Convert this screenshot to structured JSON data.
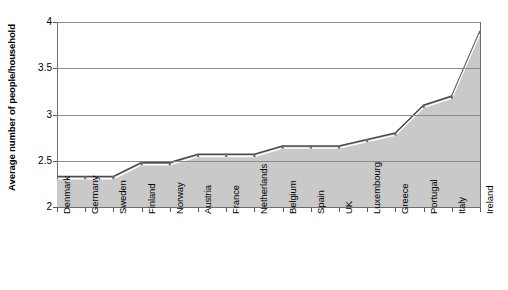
{
  "chart_data": {
    "type": "area",
    "title": "",
    "xlabel": "",
    "ylabel": "Average number of people/household",
    "ylim": [
      2,
      4
    ],
    "y_ticks": [
      "2",
      "2.5",
      "3",
      "3.5",
      "4"
    ],
    "y_tick_values": [
      2,
      2.5,
      3,
      3.5,
      4
    ],
    "grid": true,
    "legend": "none",
    "categories": [
      "Denmark",
      "Germany",
      "Sweden",
      "Finland",
      "Norway",
      "Austria",
      "France",
      "Netherlands",
      "Belgium",
      "Spain",
      "UK",
      "Luxembourg",
      "Greece",
      "Portugal",
      "Italy",
      "Ireland"
    ],
    "values": [
      2.33,
      2.33,
      2.33,
      2.48,
      2.48,
      2.57,
      2.57,
      2.57,
      2.66,
      2.66,
      2.66,
      2.73,
      2.8,
      3.1,
      3.2,
      3.9
    ],
    "colors": {
      "area_fill": "#c9c9c9",
      "line": "#4a4a4a",
      "grid": "#8a8a8a",
      "axis": "#6e6e6e",
      "text": "#000000"
    }
  }
}
